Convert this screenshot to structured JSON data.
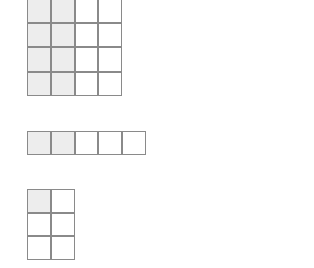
{
  "page": {
    "background_color": "#ffffff",
    "width": 314,
    "height": 268
  },
  "style": {
    "border_color": "#8a8a8a",
    "shaded_fill": "#ededed",
    "empty_fill": "#ffffff",
    "cell_size_px": 23.8
  },
  "figures": [
    {
      "id": "grid-1",
      "name": "four-by-four-grid",
      "columns": 4,
      "rows": 4,
      "clipped_top": true,
      "shaded_count": 8,
      "total_cells": 16,
      "shaded_fraction": "8/16",
      "cells": [
        [
          1,
          1,
          0,
          0
        ],
        [
          1,
          1,
          0,
          0
        ],
        [
          1,
          1,
          0,
          0
        ],
        [
          1,
          1,
          0,
          0
        ]
      ]
    },
    {
      "id": "grid-2",
      "name": "one-by-five-strip",
      "columns": 5,
      "rows": 1,
      "clipped_top": false,
      "shaded_count": 2,
      "total_cells": 5,
      "shaded_fraction": "2/5",
      "cells": [
        [
          1,
          1,
          0,
          0,
          0
        ]
      ]
    },
    {
      "id": "grid-3",
      "name": "three-by-two-grid",
      "columns": 2,
      "rows": 3,
      "clipped_top": false,
      "shaded_count": 1,
      "total_cells": 6,
      "shaded_fraction": "1/6",
      "cells": [
        [
          1,
          0
        ],
        [
          0,
          0
        ],
        [
          0,
          0
        ]
      ]
    }
  ]
}
